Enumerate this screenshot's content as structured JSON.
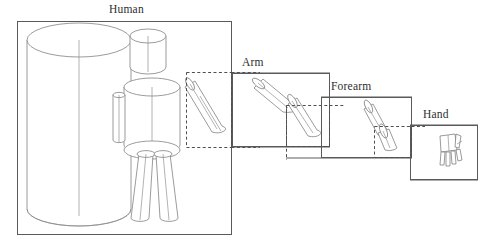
{
  "diagram": {
    "title_visible": false,
    "type": "hierarchical-body-part-decomposition",
    "stroke_color": "#6e6e6e",
    "box_stroke_color": "#5a5a5a",
    "dashed_stroke_color": "#555555",
    "background_color": "#ffffff",
    "label_color": "#2e2e2e"
  },
  "levels": [
    {
      "id": "human",
      "label": "Human",
      "order": 1,
      "box": {
        "x": 17,
        "y": 21,
        "width": 215,
        "height": 214
      },
      "label_pos": {
        "x": 109,
        "y": 4
      },
      "parts": [
        "body-cylinder",
        "head",
        "torso",
        "left-arm",
        "right-upper-arm",
        "right-forearm",
        "left-leg",
        "right-leg"
      ],
      "zoom_region": {
        "x": 186,
        "y": 72,
        "width": 46,
        "height": 76
      }
    },
    {
      "id": "arm",
      "label": "Arm",
      "order": 2,
      "box": {
        "x": 232,
        "y": 73,
        "width": 98,
        "height": 74
      },
      "label_pos": {
        "x": 242,
        "y": 57
      },
      "parts": [
        "upper-arm-cylinder",
        "forearm-cylinder"
      ],
      "zoom_region": {
        "x": 286,
        "y": 105,
        "width": 44,
        "height": 42
      }
    },
    {
      "id": "forearm",
      "label": "Forearm",
      "order": 3,
      "box": {
        "x": 321,
        "y": 97,
        "width": 91,
        "height": 61
      },
      "label_pos": {
        "x": 331,
        "y": 81
      },
      "parts": [
        "forearm-cylinder",
        "hand-cylinder"
      ],
      "zoom_region": {
        "x": 374,
        "y": 127,
        "width": 38,
        "height": 31
      }
    },
    {
      "id": "hand",
      "label": "Hand",
      "order": 4,
      "box": {
        "x": 410,
        "y": 125,
        "width": 68,
        "height": 55
      },
      "label_pos": {
        "x": 423,
        "y": 109
      },
      "parts": [
        "palm",
        "thumb",
        "index-finger",
        "middle-finger",
        "ring-finger",
        "little-finger"
      ],
      "zoom_region": null
    }
  ],
  "connectors": [
    {
      "from": "human",
      "to": "arm",
      "style": "dashed-then-solid"
    },
    {
      "from": "arm",
      "to": "forearm",
      "style": "dashed-then-solid"
    },
    {
      "from": "forearm",
      "to": "hand",
      "style": "dashed-then-solid"
    }
  ]
}
